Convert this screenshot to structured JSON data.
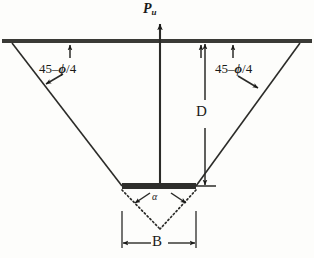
{
  "figure": {
    "background_color": "#fdfdfb",
    "ink_color": "#1a1a18",
    "labels": {
      "load": "P",
      "load_subscript": "u",
      "depth": "D",
      "width": "B",
      "angle_alpha": "α",
      "wedge_angle_left_prefix": "45",
      "wedge_angle_left_minus": "–",
      "wedge_angle_left_phi": "ϕ",
      "wedge_angle_left_divisor": "/4",
      "wedge_angle_right_prefix": "45",
      "wedge_angle_right_minus": "–",
      "wedge_angle_right_phi": "ϕ",
      "wedge_angle_right_divisor": "/4"
    },
    "geometry": {
      "ground_line": {
        "x1": 2,
        "y1": 41,
        "x2": 312,
        "y2": 41,
        "thickness": 4
      },
      "wedge_left": {
        "x1": 12,
        "y1": 43,
        "x2": 122,
        "y2": 186
      },
      "wedge_right": {
        "x1": 300,
        "y1": 43,
        "x2": 196,
        "y2": 186
      },
      "footing_bar": {
        "x": 122,
        "y": 183,
        "width": 74,
        "height": 6
      },
      "load_arrow": {
        "x": 160,
        "y_top": 24,
        "y_bottom": 186
      },
      "depth_dimension": {
        "x": 205,
        "y_top": 43,
        "y_bottom": 186
      },
      "width_dimension": {
        "y": 243,
        "x_left": 122,
        "x_right": 196
      },
      "dotted_wedge_apex": {
        "x": 160,
        "y": 229
      }
    }
  }
}
